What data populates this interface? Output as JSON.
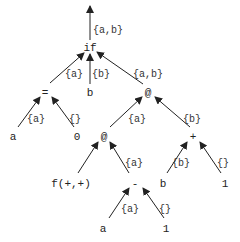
{
  "diagram": {
    "type": "expression-tree",
    "root_output_label": "{a,b}",
    "nodes": [
      {
        "id": "if",
        "label": "if",
        "x": 90,
        "y": 48
      },
      {
        "id": "eq",
        "label": "=",
        "x": 45,
        "y": 93
      },
      {
        "id": "b1",
        "label": "b",
        "x": 90,
        "y": 93
      },
      {
        "id": "at1",
        "label": "@",
        "x": 148,
        "y": 93
      },
      {
        "id": "a1",
        "label": "a",
        "x": 13,
        "y": 137
      },
      {
        "id": "zero",
        "label": "0",
        "x": 77,
        "y": 137
      },
      {
        "id": "at2",
        "label": "@",
        "x": 104,
        "y": 137
      },
      {
        "id": "plus",
        "label": "+",
        "x": 193,
        "y": 137
      },
      {
        "id": "f",
        "label": "f(+,+)",
        "x": 71,
        "y": 184
      },
      {
        "id": "minus",
        "label": "-",
        "x": 135,
        "y": 184
      },
      {
        "id": "b2",
        "label": "b",
        "x": 163,
        "y": 184
      },
      {
        "id": "one1",
        "label": "1",
        "x": 225,
        "y": 184
      },
      {
        "id": "a2",
        "label": "a",
        "x": 103,
        "y": 229
      },
      {
        "id": "one2",
        "label": "1",
        "x": 166,
        "y": 229
      }
    ],
    "edges": [
      {
        "from": "eq",
        "to": "if",
        "label": "{a}"
      },
      {
        "from": "b1",
        "to": "if",
        "label": "{b}"
      },
      {
        "from": "at1",
        "to": "if",
        "label": "{a,b}"
      },
      {
        "from": "a1",
        "to": "eq",
        "label": "{a}"
      },
      {
        "from": "zero",
        "to": "eq",
        "label": "{}"
      },
      {
        "from": "at2",
        "to": "at1",
        "label": "{a}"
      },
      {
        "from": "plus",
        "to": "at1",
        "label": "{b}"
      },
      {
        "from": "f",
        "to": "at2",
        "label": ""
      },
      {
        "from": "minus",
        "to": "at2",
        "label": "{a}"
      },
      {
        "from": "b2",
        "to": "plus",
        "label": "{b}"
      },
      {
        "from": "one1",
        "to": "plus",
        "label": "{}"
      },
      {
        "from": "a2",
        "to": "minus",
        "label": "{a}"
      },
      {
        "from": "one2",
        "to": "minus",
        "label": "{}"
      }
    ]
  },
  "labels": {
    "root": "{a,b}",
    "if": "if",
    "eq": "=",
    "b1": "b",
    "at1": "@",
    "a1": "a",
    "zero": "0",
    "at2": "@",
    "plus": "+",
    "f": "f(+,+)",
    "minus": "-",
    "b2": "b",
    "one1": "1",
    "a2": "a",
    "one2": "1",
    "e_eq_if": "{a}",
    "e_b_if": "{b}",
    "e_at_if": "{a,b}",
    "e_a_eq": "{a}",
    "e_0_eq": "{}",
    "e_at2_at1": "{a}",
    "e_plus_at1": "{b}",
    "e_minus_at2": "{a}",
    "e_b_plus": "{b}",
    "e_1_plus": "{}",
    "e_a_minus": "{a}",
    "e_1_minus": "{}"
  }
}
